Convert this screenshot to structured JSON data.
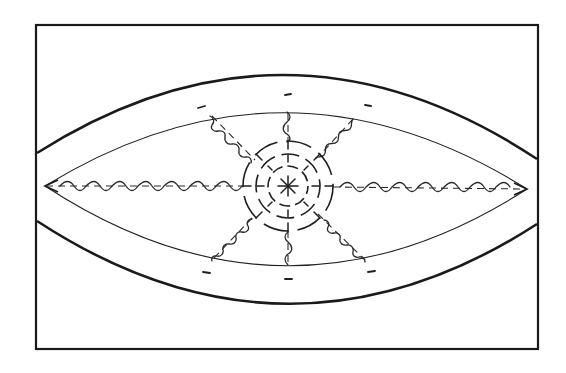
{
  "diagram": {
    "title": "",
    "description": "Line drawing of an eye/lens shaped form inside a rectangular frame, with concentric dashed circles at the center and wavy radial lines extending to the inner boundary",
    "colors": {
      "ink": "#1a1a1a",
      "background": "#ffffff"
    },
    "frame": {
      "x": 36,
      "y": 25,
      "width": 502,
      "height": 324
    },
    "outer_lens": {
      "left_top_y": 153,
      "left_bottom_y": 221,
      "right_top_y": 159,
      "right_bottom_y": 224,
      "peak_y": 75,
      "trough_y": 303
    },
    "inner_lens": {
      "left_corner": [
        45,
        186
      ],
      "right_corner": [
        527,
        189
      ],
      "peak_y": 112,
      "trough_y": 266
    },
    "center": {
      "x": 288,
      "y": 186,
      "rings": [
        45,
        32,
        20
      ],
      "star_radius": 10,
      "star_spokes": 8
    },
    "radial_lines": [
      {
        "name": "left",
        "style": "wavy"
      },
      {
        "name": "right",
        "style": "wavy"
      },
      {
        "name": "top",
        "style": "wavy"
      },
      {
        "name": "bottom",
        "style": "wavy"
      },
      {
        "name": "upper-left",
        "style": "wavy"
      },
      {
        "name": "upper-right",
        "style": "wavy"
      },
      {
        "name": "lower-left",
        "style": "wavy"
      },
      {
        "name": "lower-right",
        "style": "wavy"
      }
    ],
    "marks": 6
  }
}
